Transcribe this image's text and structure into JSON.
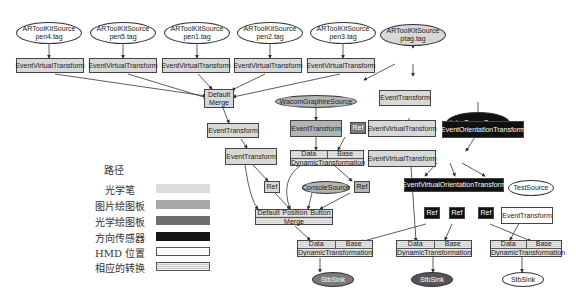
{
  "diagram": {
    "sources": [
      {
        "line1": "ARToolKitSource",
        "line2": "pen4.tag"
      },
      {
        "line1": "ARToolKitSource",
        "line2": "pen5.tag"
      },
      {
        "line1": "ARToolKitSource",
        "line2": "pen1.tag"
      },
      {
        "line1": "ARToolKitSource",
        "line2": "pen2.tag"
      },
      {
        "line1": "ARToolKitSource",
        "line2": "pen3.tag"
      },
      {
        "line1": "ARToolKitSource",
        "line2": "ptag.tag"
      }
    ],
    "event_virtual_transform": "EventVirtualTransform",
    "event_transform": "EventTransform",
    "default_merge": {
      "line1": "Default",
      "line2": "Merge"
    },
    "wacom_source": "WacomGraphireSource",
    "console_source": "ConsoleSource",
    "intersense_source": "InterSenseSource",
    "test_source": "TestSource",
    "event_orientation_transform": "EventOrientationTransform",
    "event_virtual_orientation_transform": "EventVirtualOrientationTransform",
    "ref": "Ref",
    "dynamic": {
      "data": "Data",
      "base": "Base",
      "label": "DynamicTransformation"
    },
    "merge3": {
      "a": "Default",
      "b": "Position",
      "c": "Button",
      "label": "Merge"
    },
    "sink": "StbSink"
  },
  "legend": {
    "title": "路径",
    "items": [
      {
        "label": "光学笔",
        "color": "#d8d8d8"
      },
      {
        "label": "图片绘图板",
        "color": "#b4b4b4"
      },
      {
        "label": "光学绘图板",
        "color": "#7a7a7a"
      },
      {
        "label": "方向传感器",
        "color": "#111111"
      },
      {
        "label": "HMD 位置",
        "color": "#ffffff"
      },
      {
        "label": "相应的转换",
        "color": "#e0e0e0"
      }
    ]
  }
}
